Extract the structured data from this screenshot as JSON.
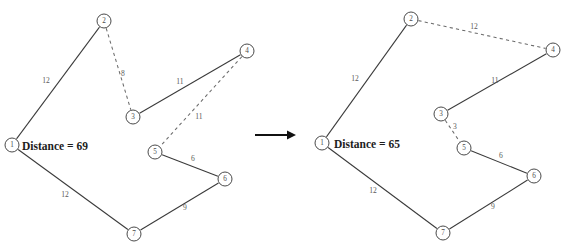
{
  "figure": {
    "width": 567,
    "height": 244,
    "background_color": "#ffffff",
    "line_color": "#3a3a3a",
    "dashed_color": "#6b6b6b",
    "text_color": "#1d1d1d"
  },
  "transition_arrow": {
    "name": "right-arrow",
    "from_x": 255,
    "to_x": 296,
    "y": 135
  },
  "panels": [
    {
      "id": "before",
      "label": "Before exchange",
      "distance_text": "Distance = 69",
      "distance_value": 69,
      "distance_x": 22,
      "distance_y": 146,
      "nodes": [
        {
          "id": "1",
          "label": "1",
          "x": 12,
          "y": 145,
          "r": 7.0
        },
        {
          "id": "2",
          "label": "2",
          "x": 104,
          "y": 21,
          "r": 7.0
        },
        {
          "id": "3",
          "label": "3",
          "x": 133,
          "y": 117,
          "r": 7.0
        },
        {
          "id": "4",
          "label": "4",
          "x": 247,
          "y": 51,
          "r": 7.0
        },
        {
          "id": "5",
          "label": "5",
          "x": 155,
          "y": 152,
          "r": 7.0
        },
        {
          "id": "6",
          "label": "6",
          "x": 225,
          "y": 179,
          "r": 7.0
        },
        {
          "id": "7",
          "label": "7",
          "x": 134,
          "y": 234,
          "r": 7.0
        }
      ],
      "edges": [
        {
          "from": "1",
          "to": "2",
          "style": "solid",
          "weight": "12",
          "wx": 46,
          "wy": 80
        },
        {
          "from": "2",
          "to": "3",
          "style": "dashed",
          "weight": "8",
          "wx": 123,
          "wy": 73
        },
        {
          "from": "3",
          "to": "4",
          "style": "solid",
          "weight": "11",
          "wx": 180,
          "wy": 81
        },
        {
          "from": "4",
          "to": "5",
          "style": "dashed",
          "weight": "11",
          "wx": 199,
          "wy": 116
        },
        {
          "from": "5",
          "to": "6",
          "style": "solid",
          "weight": "6",
          "wx": 193,
          "wy": 158
        },
        {
          "from": "6",
          "to": "7",
          "style": "solid",
          "weight": "9",
          "wx": 185,
          "wy": 207
        },
        {
          "from": "7",
          "to": "1",
          "style": "solid",
          "weight": "12",
          "wx": 65,
          "wy": 194
        }
      ]
    },
    {
      "id": "after",
      "label": "After exchange",
      "distance_text": "Distance = 65",
      "distance_value": 65,
      "distance_x": 334,
      "distance_y": 144,
      "nodes": [
        {
          "id": "1",
          "label": "1",
          "x": 322,
          "y": 143,
          "r": 7.0
        },
        {
          "id": "2",
          "label": "2",
          "x": 411,
          "y": 19,
          "r": 7.0
        },
        {
          "id": "3",
          "label": "3",
          "x": 441,
          "y": 114,
          "r": 7.0
        },
        {
          "id": "4",
          "label": "4",
          "x": 553,
          "y": 50,
          "r": 7.0
        },
        {
          "id": "5",
          "label": "5",
          "x": 464,
          "y": 148,
          "r": 7.0
        },
        {
          "id": "6",
          "label": "6",
          "x": 534,
          "y": 176,
          "r": 7.0
        },
        {
          "id": "7",
          "label": "7",
          "x": 443,
          "y": 233,
          "r": 7.0
        }
      ],
      "edges": [
        {
          "from": "1",
          "to": "2",
          "style": "solid",
          "weight": "12",
          "wx": 355,
          "wy": 78
        },
        {
          "from": "2",
          "to": "4",
          "style": "dashed",
          "weight": "12",
          "wx": 474,
          "wy": 26
        },
        {
          "from": "4",
          "to": "3",
          "style": "solid",
          "weight": "11",
          "wx": 495,
          "wy": 80
        },
        {
          "from": "3",
          "to": "5",
          "style": "dashed",
          "weight": "3",
          "wx": 455,
          "wy": 126
        },
        {
          "from": "5",
          "to": "6",
          "style": "solid",
          "weight": "6",
          "wx": 501,
          "wy": 155
        },
        {
          "from": "6",
          "to": "7",
          "style": "solid",
          "weight": "9",
          "wx": 493,
          "wy": 206
        },
        {
          "from": "7",
          "to": "1",
          "style": "solid",
          "weight": "12",
          "wx": 373,
          "wy": 190
        }
      ]
    }
  ]
}
